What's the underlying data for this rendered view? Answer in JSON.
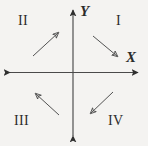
{
  "diagram": {
    "background_color": "#f4f3f1",
    "stroke_color": "#3a3a3a",
    "axes": {
      "x_label": "X",
      "y_label": "Y",
      "origin": {
        "x": 73,
        "y": 72
      },
      "x_extent": [
        8,
        140
      ],
      "y_extent": [
        8,
        138
      ]
    },
    "quadrants": [
      {
        "id": "I",
        "label": "I",
        "x": 116,
        "y": 14,
        "arrow_direction": "down-right",
        "arrow_from": [
          93,
          36
        ],
        "arrow_to": [
          118,
          57
        ]
      },
      {
        "id": "II",
        "label": "II",
        "x": 18,
        "y": 14,
        "arrow_direction": "up-right",
        "arrow_from": [
          33,
          56
        ],
        "arrow_to": [
          59,
          32
        ]
      },
      {
        "id": "III",
        "label": "III",
        "x": 14,
        "y": 114,
        "arrow_direction": "up-left",
        "arrow_from": [
          59,
          115
        ],
        "arrow_to": [
          35,
          93
        ]
      },
      {
        "id": "IV",
        "label": "IV",
        "x": 108,
        "y": 114,
        "arrow_direction": "down-left",
        "arrow_from": [
          113,
          92
        ],
        "arrow_to": [
          90,
          114
        ]
      }
    ]
  }
}
